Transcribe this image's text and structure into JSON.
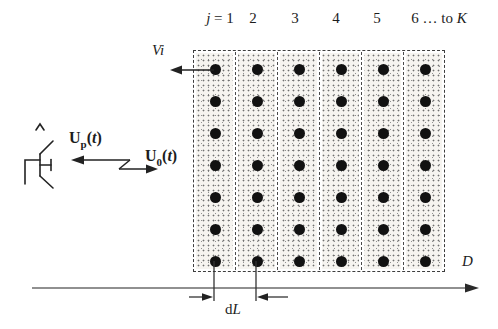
{
  "figure": {
    "ink_color": "#1c1c1c",
    "dot_color": "#111111",
    "axis_color": "#6b6b6b",
    "stipple_color": "#6f6f6f"
  },
  "column_headers": [
    {
      "var": "j",
      "rest": " = 1"
    },
    {
      "rest": "2"
    },
    {
      "rest": "3"
    },
    {
      "rest": "4"
    },
    {
      "rest": "5"
    },
    {
      "rest": "6 … to ",
      "var2": "K"
    }
  ],
  "labels": {
    "vi": "Vi",
    "up": {
      "base": "U",
      "sub": "p",
      "open": "(",
      "var": "t",
      "close": ")"
    },
    "u0": {
      "base": "U",
      "sub": "0",
      "open": "(",
      "var": "t",
      "close": ")"
    },
    "d_axis": "D",
    "dl": {
      "pre": "d",
      "var": "L"
    }
  },
  "grid": {
    "columns": 6,
    "rows": 7,
    "dot_diameter": 11
  }
}
